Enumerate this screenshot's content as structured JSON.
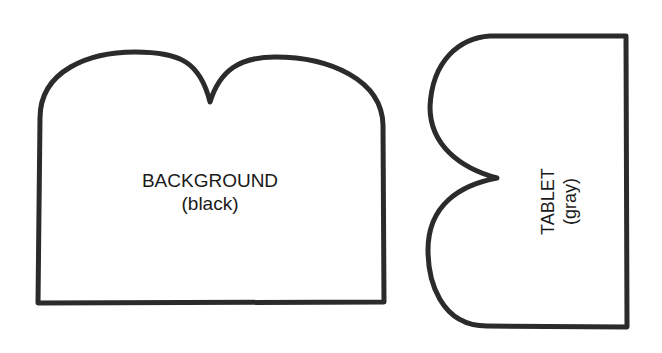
{
  "shapes": {
    "background": {
      "title": "BACKGROUND",
      "subtitle": "(black)"
    },
    "tablet": {
      "title": "TABLET",
      "subtitle": "(gray)"
    }
  },
  "colors": {
    "outline": "#2b2b2b",
    "fill": "#ffffff",
    "text": "#1a1a1a"
  }
}
